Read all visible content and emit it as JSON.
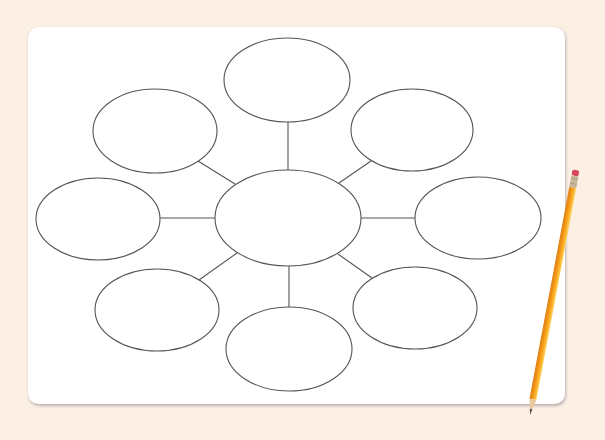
{
  "diagram": {
    "type": "bubble-map",
    "title": "",
    "stroke_color": "#555555",
    "board_color": "#ffffff",
    "background_color": "#fcefe3",
    "center_node": {
      "id": "center",
      "label": "",
      "cx": 288,
      "cy": 218,
      "rx": 73,
      "ry": 48
    },
    "nodes": [
      {
        "id": "top",
        "label": "",
        "cx": 287,
        "cy": 80,
        "rx": 63,
        "ry": 42
      },
      {
        "id": "upper-right",
        "label": "",
        "cx": 412,
        "cy": 130,
        "rx": 61,
        "ry": 41
      },
      {
        "id": "right",
        "label": "",
        "cx": 478,
        "cy": 218,
        "rx": 63,
        "ry": 41
      },
      {
        "id": "lower-right",
        "label": "",
        "cx": 415,
        "cy": 308,
        "rx": 62,
        "ry": 41
      },
      {
        "id": "bottom",
        "label": "",
        "cx": 289,
        "cy": 349,
        "rx": 63,
        "ry": 42
      },
      {
        "id": "lower-left",
        "label": "",
        "cx": 157,
        "cy": 310,
        "rx": 62,
        "ry": 41
      },
      {
        "id": "left",
        "label": "",
        "cx": 98,
        "cy": 219,
        "rx": 62,
        "ry": 41
      },
      {
        "id": "upper-left",
        "label": "",
        "cx": 155,
        "cy": 131,
        "rx": 62,
        "ry": 42
      }
    ],
    "edges": [
      {
        "from": "center",
        "to": "top",
        "x1": 288,
        "y1": 170,
        "x2": 288,
        "y2": 122
      },
      {
        "from": "center",
        "to": "upper-right",
        "x1": 339,
        "y1": 183,
        "x2": 371,
        "y2": 161
      },
      {
        "from": "center",
        "to": "right",
        "x1": 361,
        "y1": 218,
        "x2": 415,
        "y2": 218
      },
      {
        "from": "center",
        "to": "lower-right",
        "x1": 338,
        "y1": 254,
        "x2": 372,
        "y2": 278
      },
      {
        "from": "center",
        "to": "bottom",
        "x1": 289,
        "y1": 266,
        "x2": 289,
        "y2": 307
      },
      {
        "from": "center",
        "to": "lower-left",
        "x1": 237,
        "y1": 253,
        "x2": 199,
        "y2": 280
      },
      {
        "from": "center",
        "to": "left",
        "x1": 215,
        "y1": 218,
        "x2": 160,
        "y2": 218
      },
      {
        "from": "center",
        "to": "upper-left",
        "x1": 235,
        "y1": 184,
        "x2": 198,
        "y2": 161
      }
    ]
  },
  "pencil": {
    "body_color": "#f7a21b",
    "eraser_color": "#d9485a",
    "ferrule_color": "#c8b89a",
    "eraser_x": 576,
    "eraser_y": 170,
    "tip_x": 530,
    "tip_y": 415
  }
}
